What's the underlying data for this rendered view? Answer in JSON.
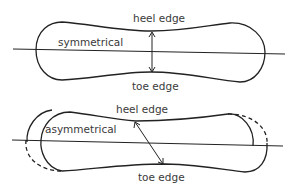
{
  "diagram": {
    "top": {
      "label": "symmetrical",
      "top_edge_label": "heel edge",
      "bottom_edge_label": "toe edge"
    },
    "bottom": {
      "label": "asymmetrical",
      "top_edge_label": "heel edge",
      "bottom_edge_label": "toe edge"
    },
    "colors": {
      "stroke": "#222222",
      "text": "#3a3a3a",
      "background": "#ffffff"
    }
  }
}
